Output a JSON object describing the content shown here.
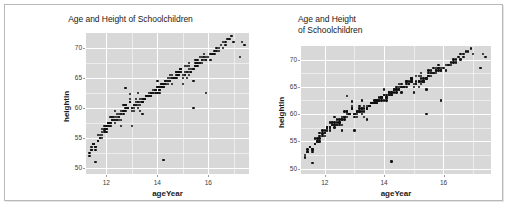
{
  "figure": {
    "panels": [
      {
        "id": "left",
        "title": "Age and Height of Schoolchildren",
        "title_align": "center",
        "title_lines": 1
      },
      {
        "id": "right",
        "title": "Age and Height\nof Schoolchildren",
        "title_align": "left",
        "title_lines": 2
      }
    ],
    "panel_bg": "#d8d8d8",
    "grid_color": "#ffffff",
    "point_color": "#111111"
  },
  "chart_data": {
    "type": "scatter",
    "title": "Age and Height of Schoolchildren",
    "xlabel": "ageYear",
    "ylabel": "heightIn",
    "xlim": [
      11.2,
      17.6
    ],
    "ylim": [
      49.0,
      72.5
    ],
    "xticks": [
      12,
      14,
      16
    ],
    "yticks": [
      50,
      55,
      60,
      65,
      70
    ],
    "xtick_labels": [
      "12",
      "14",
      "16"
    ],
    "ytick_labels": [
      "50",
      "55",
      "60",
      "65",
      "70"
    ],
    "xminor": [
      13,
      15,
      17
    ],
    "yminor": [
      52.5,
      57.5,
      62.5,
      67.5
    ],
    "grid": true,
    "legend": "none",
    "series": [
      {
        "name": "heightweight",
        "marker": "filled-circle",
        "x": [
          11.92,
          12.92,
          12.75,
          13.42,
          15.92,
          14.25,
          15.42,
          11.83,
          13.33,
          11.67,
          12.67,
          14.75,
          12.08,
          12.92,
          13.25,
          15.5,
          12.58,
          14.42,
          11.5,
          12.42,
          13.92,
          11.58,
          12.0,
          13.58,
          14.0,
          12.25,
          15.08,
          14.92,
          16.08,
          12.33,
          13.17,
          11.75,
          14.58,
          13.75,
          12.83,
          15.25,
          13.08,
          14.17,
          11.42,
          16.42,
          12.5,
          13.5,
          15.75,
          14.33,
          12.17,
          16.25,
          13.67,
          14.83,
          15.17,
          11.33,
          12.58,
          13.83,
          14.67,
          15.58,
          12.75,
          13.25,
          14.08,
          15.33,
          16.58,
          11.92,
          12.33,
          13.42,
          14.5,
          15.67,
          12.0,
          13.0,
          14.25,
          15.83,
          16.75,
          12.17,
          13.58,
          14.92,
          15.08,
          11.67,
          12.92,
          13.75,
          14.42,
          15.5,
          16.0,
          12.42,
          13.17,
          14.0,
          15.25,
          11.83,
          12.67,
          13.92,
          14.75,
          15.92,
          16.33,
          12.08,
          13.33,
          14.17,
          15.42,
          11.58,
          12.83,
          13.5,
          14.58,
          15.17,
          16.17,
          12.25,
          13.08,
          14.33,
          15.58,
          11.5,
          12.5,
          13.67,
          14.83,
          15.75,
          16.5,
          12.75,
          13.83,
          14.08,
          15.33,
          11.75,
          12.92,
          13.25,
          14.67,
          15.0,
          16.67,
          12.33,
          13.42,
          14.25,
          15.67,
          11.42,
          12.17,
          13.58,
          14.5,
          15.83,
          16.08,
          12.58,
          13.0,
          14.92,
          15.25,
          11.92,
          12.42,
          13.75,
          14.42,
          15.5,
          16.92,
          12.67,
          13.17,
          14.0,
          15.08,
          11.83,
          12.08,
          13.92,
          14.58,
          15.92,
          16.25,
          12.5,
          13.33,
          14.75,
          15.42,
          11.67,
          12.25,
          13.5,
          14.17,
          15.58,
          17.0,
          12.83,
          13.67,
          14.33,
          15.17,
          11.58,
          12.0,
          13.08,
          14.83,
          15.75,
          16.42,
          12.92,
          13.25,
          14.67,
          15.33,
          11.5,
          12.58,
          13.42,
          14.08,
          15.67,
          16.83,
          12.17,
          13.75,
          14.5,
          15.0,
          11.75,
          12.33,
          13.0,
          14.25,
          15.83,
          17.25,
          12.75,
          13.58,
          14.92,
          15.25,
          11.92,
          12.42,
          13.33,
          14.75,
          15.42,
          16.58,
          12.08,
          13.5,
          14.17,
          15.58,
          11.33,
          12.67,
          13.83,
          14.42,
          15.92,
          16.17,
          12.25,
          13.17,
          14.58,
          15.08,
          11.83,
          12.5,
          13.25,
          14.0,
          15.75,
          16.33,
          12.92,
          13.92,
          14.83,
          15.33,
          11.67,
          12.0,
          13.42,
          14.25,
          15.5,
          17.33,
          12.58,
          13.08,
          14.67,
          15.17,
          11.42,
          12.83,
          13.67,
          14.5,
          15.83,
          16.67,
          12.33,
          13.75,
          14.08,
          15.0,
          11.58,
          12.75,
          13.0,
          14.92,
          15.25,
          17.42
        ],
        "y": [
          56.3,
          62.3,
          63.3,
          59.0,
          62.5,
          51.3,
          60.0,
          56.5,
          59.5,
          55.5,
          59.0,
          66.0,
          57.5,
          61.0,
          62.5,
          68.0,
          57.0,
          65.0,
          54.0,
          58.0,
          63.0,
          53.0,
          57.0,
          62.0,
          64.5,
          58.5,
          67.0,
          66.5,
          69.0,
          58.0,
          61.5,
          55.0,
          65.5,
          62.0,
          60.0,
          67.5,
          60.5,
          64.0,
          53.5,
          70.0,
          59.0,
          61.5,
          68.5,
          64.5,
          57.5,
          69.5,
          62.5,
          66.0,
          67.0,
          52.5,
          58.0,
          63.0,
          65.0,
          68.0,
          60.5,
          61.0,
          63.5,
          66.5,
          71.0,
          57.0,
          59.5,
          61.0,
          65.5,
          68.5,
          56.5,
          60.0,
          64.0,
          69.0,
          71.5,
          58.5,
          62.0,
          66.5,
          66.0,
          54.5,
          61.5,
          62.5,
          64.5,
          67.5,
          68.5,
          59.0,
          60.5,
          63.5,
          67.0,
          56.0,
          59.5,
          63.0,
          65.5,
          68.0,
          69.5,
          57.5,
          61.0,
          64.0,
          66.5,
          53.5,
          60.0,
          61.5,
          65.0,
          66.0,
          69.0,
          58.0,
          60.5,
          64.5,
          67.5,
          54.0,
          58.5,
          62.0,
          65.5,
          68.0,
          70.5,
          60.0,
          62.5,
          63.0,
          66.0,
          55.5,
          61.0,
          60.5,
          65.0,
          65.5,
          71.0,
          58.5,
          61.5,
          64.0,
          67.5,
          53.0,
          57.0,
          62.0,
          65.0,
          68.5,
          68.0,
          59.5,
          60.0,
          66.0,
          66.5,
          56.5,
          58.0,
          62.5,
          64.5,
          67.0,
          72.0,
          60.5,
          61.0,
          63.5,
          65.5,
          55.0,
          57.5,
          63.0,
          64.0,
          68.5,
          69.0,
          58.0,
          61.5,
          66.0,
          66.5,
          54.5,
          58.5,
          61.5,
          63.5,
          67.5,
          71.0,
          60.0,
          62.0,
          64.0,
          65.0,
          53.5,
          56.5,
          60.0,
          65.5,
          68.0,
          69.5,
          61.0,
          61.0,
          65.0,
          66.0,
          54.0,
          59.0,
          61.0,
          63.0,
          67.5,
          71.5,
          57.5,
          62.5,
          64.5,
          65.0,
          55.0,
          58.0,
          59.5,
          63.5,
          68.0,
          68.5,
          60.5,
          62.0,
          66.5,
          66.0,
          56.0,
          58.5,
          60.5,
          65.0,
          64.5,
          70.0,
          57.0,
          61.5,
          63.5,
          67.0,
          52.0,
          59.5,
          62.5,
          64.0,
          68.0,
          69.0,
          58.0,
          60.5,
          65.0,
          65.5,
          55.5,
          58.5,
          60.0,
          62.5,
          67.5,
          70.0,
          61.0,
          62.5,
          65.5,
          66.0,
          54.5,
          56.0,
          61.0,
          63.5,
          67.0,
          71.0,
          59.0,
          59.5,
          65.0,
          66.0,
          53.0,
          60.0,
          62.0,
          64.5,
          68.5,
          70.5,
          57.5,
          62.0,
          62.5,
          64.0,
          51.0,
          59.5,
          57.0,
          66.0,
          65.5,
          70.5
        ]
      }
    ]
  }
}
